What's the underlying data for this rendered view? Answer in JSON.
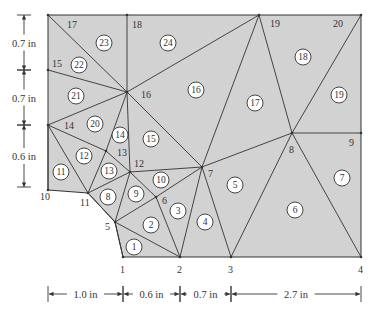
{
  "diagram": {
    "type": "finite-element-mesh",
    "fill_color": "#d2d2d2",
    "line_color": "#333333",
    "nodes": [
      {
        "id": "1",
        "x": 123,
        "y": 257,
        "lx": 120,
        "ly": 273
      },
      {
        "id": "2",
        "x": 180,
        "y": 257,
        "lx": 177,
        "ly": 273
      },
      {
        "id": "3",
        "x": 231,
        "y": 257,
        "lx": 228,
        "ly": 273
      },
      {
        "id": "4",
        "x": 361,
        "y": 257,
        "lx": 358,
        "ly": 273
      },
      {
        "id": "5",
        "x": 115,
        "y": 222,
        "lx": 105,
        "ly": 230
      },
      {
        "id": "6",
        "x": 156,
        "y": 197,
        "lx": 162,
        "ly": 204
      },
      {
        "id": "7",
        "x": 202,
        "y": 167,
        "lx": 208,
        "ly": 177
      },
      {
        "id": "8",
        "x": 292,
        "y": 133,
        "lx": 289,
        "ly": 153
      },
      {
        "id": "9",
        "x": 361,
        "y": 133,
        "lx": 349,
        "ly": 146
      },
      {
        "id": "10",
        "x": 48,
        "y": 190,
        "lx": 40,
        "ly": 200
      },
      {
        "id": "11",
        "x": 88,
        "y": 193,
        "lx": 80,
        "ly": 206
      },
      {
        "id": "12",
        "x": 130,
        "y": 172,
        "lx": 134,
        "ly": 167
      },
      {
        "id": "13",
        "x": 106,
        "y": 151,
        "lx": 117,
        "ly": 156
      },
      {
        "id": "14",
        "x": 48,
        "y": 125,
        "lx": 64,
        "ly": 129
      },
      {
        "id": "15",
        "x": 48,
        "y": 70,
        "lx": 52,
        "ly": 67
      },
      {
        "id": "16",
        "x": 127,
        "y": 92,
        "lx": 141,
        "ly": 98
      },
      {
        "id": "17",
        "x": 48,
        "y": 15,
        "lx": 67,
        "ly": 28
      },
      {
        "id": "18",
        "x": 127,
        "y": 15,
        "lx": 132,
        "ly": 28
      },
      {
        "id": "19",
        "x": 259,
        "y": 15,
        "lx": 270,
        "ly": 27
      },
      {
        "id": "20",
        "x": 361,
        "y": 15,
        "lx": 333,
        "ly": 27
      }
    ],
    "boundary": [
      "1",
      "2",
      "3",
      "4",
      "9",
      "20",
      "19",
      "18",
      "17",
      "15",
      "14",
      "10",
      "11",
      "5"
    ],
    "edges": [
      [
        "1",
        "5"
      ],
      [
        "5",
        "2"
      ],
      [
        "5",
        "6"
      ],
      [
        "6",
        "2"
      ],
      [
        "6",
        "7"
      ],
      [
        "7",
        "2"
      ],
      [
        "7",
        "3"
      ],
      [
        "3",
        "8"
      ],
      [
        "8",
        "4"
      ],
      [
        "5",
        "11"
      ],
      [
        "5",
        "12"
      ],
      [
        "12",
        "6"
      ],
      [
        "12",
        "7"
      ],
      [
        "11",
        "12"
      ],
      [
        "11",
        "13"
      ],
      [
        "13",
        "12"
      ],
      [
        "10",
        "14"
      ],
      [
        "14",
        "11"
      ],
      [
        "14",
        "13"
      ],
      [
        "13",
        "16"
      ],
      [
        "16",
        "12"
      ],
      [
        "16",
        "7"
      ],
      [
        "14",
        "16"
      ],
      [
        "15",
        "16"
      ],
      [
        "17",
        "16"
      ],
      [
        "18",
        "16"
      ],
      [
        "16",
        "19"
      ],
      [
        "19",
        "7"
      ],
      [
        "7",
        "8"
      ],
      [
        "19",
        "8"
      ],
      [
        "8",
        "20"
      ],
      [
        "8",
        "9"
      ]
    ],
    "elements": [
      {
        "id": "1",
        "x": 134,
        "y": 247
      },
      {
        "id": "2",
        "x": 151,
        "y": 225
      },
      {
        "id": "3",
        "x": 178,
        "y": 211
      },
      {
        "id": "4",
        "x": 205,
        "y": 222
      },
      {
        "id": "5",
        "x": 235,
        "y": 185
      },
      {
        "id": "6",
        "x": 295,
        "y": 210
      },
      {
        "id": "7",
        "x": 342,
        "y": 178
      },
      {
        "id": "8",
        "x": 108,
        "y": 197
      },
      {
        "id": "9",
        "x": 136,
        "y": 194
      },
      {
        "id": "10",
        "x": 161,
        "y": 180
      },
      {
        "id": "11",
        "x": 61,
        "y": 172
      },
      {
        "id": "12",
        "x": 84,
        "y": 156
      },
      {
        "id": "13",
        "x": 109,
        "y": 171
      },
      {
        "id": "14",
        "x": 120,
        "y": 135
      },
      {
        "id": "15",
        "x": 151,
        "y": 139
      },
      {
        "id": "16",
        "x": 196,
        "y": 90
      },
      {
        "id": "17",
        "x": 255,
        "y": 103
      },
      {
        "id": "18",
        "x": 303,
        "y": 57
      },
      {
        "id": "19",
        "x": 339,
        "y": 95
      },
      {
        "id": "20",
        "x": 95,
        "y": 124
      },
      {
        "id": "21",
        "x": 76,
        "y": 96
      },
      {
        "id": "22",
        "x": 79,
        "y": 65
      },
      {
        "id": "23",
        "x": 104,
        "y": 43
      },
      {
        "id": "24",
        "x": 168,
        "y": 43
      }
    ]
  },
  "dimensions": {
    "vertical": [
      {
        "label": "0.7 in",
        "y1": 15,
        "y2": 70
      },
      {
        "label": "0.7 in",
        "y1": 70,
        "y2": 125
      },
      {
        "label": "0.6 in",
        "y1": 125,
        "y2": 187
      }
    ],
    "horizontal": [
      {
        "label": "1.0 in",
        "x1": 48,
        "x2": 123
      },
      {
        "label": "0.6 in",
        "x1": 123,
        "x2": 180
      },
      {
        "label": "0.7 in",
        "x1": 180,
        "x2": 231
      },
      {
        "label": "2.7 in",
        "x1": 231,
        "x2": 361
      }
    ]
  }
}
